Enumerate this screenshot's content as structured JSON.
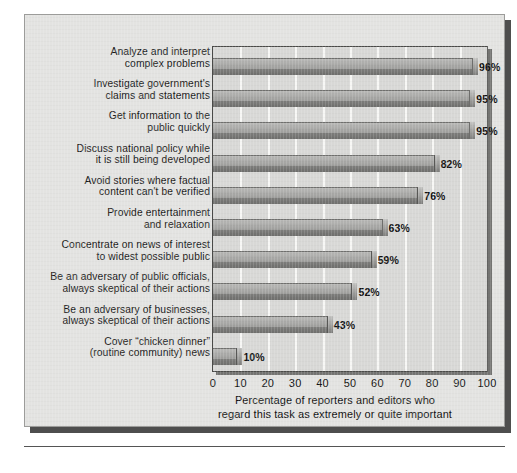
{
  "chart_data": {
    "type": "bar",
    "orientation": "horizontal",
    "title": "",
    "xlabel": "Percentage of reporters and editors who regard this task as extremely or quite important",
    "ylabel": "",
    "xlim": [
      0,
      100
    ],
    "xticks": [
      "0",
      "10",
      "20",
      "30",
      "40",
      "50",
      "60",
      "70",
      "80",
      "90",
      "100"
    ],
    "grid": "vertical",
    "legend": "none",
    "categories": [
      "Analyze and interpret\ncomplex problems",
      "Investigate government's\nclaims and statements",
      "Get information to the\npublic quickly",
      "Discuss national policy while\nit is still being developed",
      "Avoid stories where factual\ncontent can't be verified",
      "Provide entertainment\nand relaxation",
      "Concentrate on news of interest\nto widest possible public",
      "Be an adversary of public officials,\nalways skeptical of their actions",
      "Be an adversary of businesses,\nalways skeptical of their actions",
      "Cover “chicken dinner”\n(routine community) news"
    ],
    "values": [
      96,
      95,
      95,
      82,
      76,
      63,
      59,
      52,
      43,
      10
    ],
    "value_labels": [
      "96%",
      "95%",
      "95%",
      "82%",
      "76%",
      "63%",
      "59%",
      "52%",
      "43%",
      "10%"
    ]
  },
  "axis": {
    "xlabel_line1": "Percentage of reporters and editors who",
    "xlabel_line2": "regard this task as extremely or quite important"
  },
  "colors": {
    "panel_background": "#e3e3e1",
    "plot_background": "#d8d8d6",
    "bar_top": "#a9a9a7",
    "bar_front": "#6e6e6c",
    "gridline": "#f7f7f5",
    "text": "#141414",
    "shadow": "#4e4e4e"
  }
}
